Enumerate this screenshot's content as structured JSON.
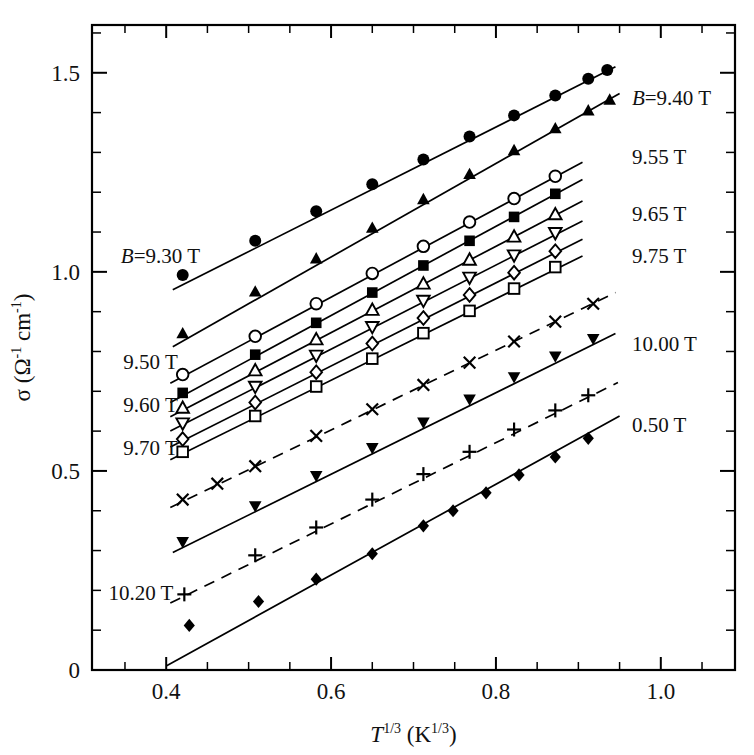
{
  "chart_data": {
    "type": "scatter",
    "title": "",
    "xlabel": "T^1/3 (K^1/3)",
    "ylabel": "σ (Ω⁻¹ cm⁻¹)",
    "xlim": [
      0.31,
      1.09
    ],
    "ylim": [
      0.0,
      1.62
    ],
    "xticks_major": [
      0.4,
      0.6,
      0.8,
      1.0
    ],
    "xticks_major_labels": [
      "0.4",
      "0.6",
      "0.8",
      "1.0"
    ],
    "xtick_minor_step": 0.05,
    "yticks_major": [
      0,
      0.5,
      1.0,
      1.5
    ],
    "yticks_major_labels": [
      "0",
      "0.5",
      "1.0",
      "1.5"
    ],
    "ytick_minor_step": 0.1,
    "grid": false,
    "legend_position": "inline-annotations",
    "frame": "box",
    "series": [
      {
        "name": "B=9.30 T",
        "label_left": "B=9.30 T",
        "label_right": "",
        "marker": "filled-circle",
        "fit": {
          "x0": 0.408,
          "y0": 0.955,
          "x1": 0.945,
          "y1": 1.515
        },
        "x": [
          0.42,
          0.508,
          0.582,
          0.65,
          0.712,
          0.768,
          0.822,
          0.872,
          0.912,
          0.935
        ],
        "y": [
          0.992,
          1.078,
          1.152,
          1.22,
          1.282,
          1.34,
          1.393,
          1.443,
          1.485,
          1.507
        ]
      },
      {
        "name": "B=9.40 T",
        "label_left": "",
        "label_right": "B=9.40 T",
        "marker": "filled-triangle-up",
        "fit": {
          "x0": 0.408,
          "y0": 0.812,
          "x1": 0.95,
          "y1": 1.448
        },
        "x": [
          0.42,
          0.508,
          0.582,
          0.65,
          0.712,
          0.768,
          0.822,
          0.872,
          0.912,
          0.938
        ],
        "y": [
          0.845,
          0.95,
          1.033,
          1.11,
          1.182,
          1.245,
          1.305,
          1.36,
          1.405,
          1.432
        ]
      },
      {
        "name": "9.50 T",
        "label_left": "9.50 T",
        "label_right": "",
        "marker": "open-circle",
        "fit": {
          "x0": 0.405,
          "y0": 0.72,
          "x1": 0.905,
          "y1": 1.275
        },
        "x": [
          0.42,
          0.508,
          0.582,
          0.65,
          0.712,
          0.768,
          0.822,
          0.872
        ],
        "y": [
          0.742,
          0.838,
          0.92,
          0.996,
          1.064,
          1.125,
          1.184,
          1.24
        ]
      },
      {
        "name": "9.55 T",
        "label_left": "",
        "label_right": "9.55 T",
        "marker": "filled-square",
        "fit": {
          "x0": 0.405,
          "y0": 0.672,
          "x1": 0.905,
          "y1": 1.232
        },
        "x": [
          0.42,
          0.508,
          0.582,
          0.65,
          0.712,
          0.768,
          0.822,
          0.872
        ],
        "y": [
          0.696,
          0.792,
          0.872,
          0.948,
          1.016,
          1.078,
          1.138,
          1.196
        ]
      },
      {
        "name": "9.60 T",
        "label_left": "9.60 T",
        "label_right": "",
        "marker": "open-triangle-up",
        "fit": {
          "x0": 0.405,
          "y0": 0.636,
          "x1": 0.905,
          "y1": 1.178
        },
        "x": [
          0.42,
          0.508,
          0.582,
          0.65,
          0.712,
          0.768,
          0.822,
          0.872
        ],
        "y": [
          0.658,
          0.752,
          0.83,
          0.904,
          0.97,
          1.03,
          1.088,
          1.144
        ]
      },
      {
        "name": "9.65 T",
        "label_left": "",
        "label_right": "9.65 T",
        "marker": "open-triangle-down",
        "fit": {
          "x0": 0.405,
          "y0": 0.6,
          "x1": 0.905,
          "y1": 1.128
        },
        "x": [
          0.42,
          0.508,
          0.582,
          0.65,
          0.712,
          0.768,
          0.822,
          0.872
        ],
        "y": [
          0.62,
          0.712,
          0.79,
          0.862,
          0.928,
          0.986,
          1.042,
          1.098
        ]
      },
      {
        "name": "9.70 T",
        "label_left": "9.70 T",
        "label_right": "",
        "marker": "open-diamond",
        "fit": {
          "x0": 0.405,
          "y0": 0.56,
          "x1": 0.905,
          "y1": 1.082
        },
        "x": [
          0.42,
          0.508,
          0.582,
          0.65,
          0.712,
          0.768,
          0.822,
          0.872
        ],
        "y": [
          0.58,
          0.672,
          0.748,
          0.82,
          0.884,
          0.942,
          0.998,
          1.052
        ]
      },
      {
        "name": "9.75 T",
        "label_left": "",
        "label_right": "9.75 T",
        "marker": "open-square",
        "fit": {
          "x0": 0.405,
          "y0": 0.528,
          "x1": 0.905,
          "y1": 1.04
        },
        "x": [
          0.42,
          0.508,
          0.582,
          0.65,
          0.712,
          0.768,
          0.822,
          0.872
        ],
        "y": [
          0.548,
          0.638,
          0.712,
          0.782,
          0.846,
          0.902,
          0.958,
          1.012
        ]
      },
      {
        "name": "10.00 T (x)",
        "label_left": "",
        "label_right": "",
        "marker": "cross-x",
        "dashed": true,
        "fit": {
          "x0": 0.405,
          "y0": 0.408,
          "x1": 0.945,
          "y1": 0.948
        },
        "x": [
          0.42,
          0.462,
          0.508,
          0.582,
          0.65,
          0.712,
          0.768,
          0.822,
          0.872,
          0.918
        ],
        "y": [
          0.428,
          0.468,
          0.512,
          0.588,
          0.655,
          0.716,
          0.772,
          0.825,
          0.875,
          0.92
        ]
      },
      {
        "name": "10.00 T",
        "label_left": "",
        "label_right": "10.00 T",
        "marker": "filled-triangle-down",
        "fit": {
          "x0": 0.408,
          "y0": 0.295,
          "x1": 0.945,
          "y1": 0.845
        },
        "x": [
          0.42,
          0.508,
          0.582,
          0.65,
          0.712,
          0.768,
          0.822,
          0.872,
          0.918
        ],
        "y": [
          0.322,
          0.412,
          0.488,
          0.558,
          0.622,
          0.68,
          0.736,
          0.788,
          0.832
        ]
      },
      {
        "name": "10.20 T",
        "label_left": "10.20 T",
        "label_right": "",
        "marker": "plus",
        "dashed": true,
        "fit": {
          "x0": 0.405,
          "y0": 0.168,
          "x1": 0.948,
          "y1": 0.722
        },
        "x": [
          0.422,
          0.508,
          0.582,
          0.65,
          0.712,
          0.768,
          0.822,
          0.872,
          0.912
        ],
        "y": [
          0.19,
          0.288,
          0.358,
          0.428,
          0.492,
          0.548,
          0.604,
          0.652,
          0.69
        ]
      },
      {
        "name": "0.50 T",
        "label_left": "",
        "label_right": "0.50 T",
        "marker": "filled-diamond",
        "fit": {
          "x0": 0.4,
          "y0": 0.01,
          "x1": 0.95,
          "y1": 0.638
        },
        "x": [
          0.428,
          0.512,
          0.582,
          0.65,
          0.712,
          0.748,
          0.788,
          0.828,
          0.872,
          0.912
        ],
        "y": [
          0.112,
          0.172,
          0.228,
          0.292,
          0.362,
          0.4,
          0.445,
          0.49,
          0.535,
          0.582
        ]
      }
    ],
    "annotations": [
      {
        "text": "B=9.30 T",
        "italic_prefix": "B",
        "x": 0.345,
        "y": 1.022,
        "anchor": "start",
        "for": "B=9.30 T"
      },
      {
        "text": "9.50 T",
        "x": 0.348,
        "y": 0.755,
        "anchor": "start",
        "for": "9.50 T"
      },
      {
        "text": "9.60 T",
        "x": 0.348,
        "y": 0.648,
        "anchor": "start",
        "for": "9.60 T"
      },
      {
        "text": "9.70 T",
        "x": 0.348,
        "y": 0.54,
        "anchor": "start",
        "for": "9.70 T"
      },
      {
        "text": "10.20 T",
        "x": 0.33,
        "y": 0.175,
        "anchor": "start",
        "for": "10.20 T"
      },
      {
        "text": "B=9.40 T",
        "italic_prefix": "B",
        "x": 0.965,
        "y": 1.42,
        "anchor": "start",
        "for": "B=9.40 T"
      },
      {
        "text": "9.55 T",
        "x": 0.965,
        "y": 1.272,
        "anchor": "start",
        "for": "9.55 T"
      },
      {
        "text": "9.65 T",
        "x": 0.965,
        "y": 1.128,
        "anchor": "start",
        "for": "9.65 T"
      },
      {
        "text": "9.75 T",
        "x": 0.965,
        "y": 1.022,
        "anchor": "start",
        "for": "9.75 T"
      },
      {
        "text": "10.00 T",
        "x": 0.965,
        "y": 0.8,
        "anchor": "start",
        "for": "10.00 T"
      },
      {
        "text": "0.50 T",
        "x": 0.965,
        "y": 0.598,
        "anchor": "start",
        "for": "0.50 T"
      }
    ],
    "axis_title_x_parts": {
      "sym": "T",
      "sup": "1/3",
      "unit_open": " (K",
      "unit_sup": "1/3",
      "unit_close": ")"
    },
    "axis_title_y_parts": {
      "sym": "σ",
      "open": " (Ω",
      "sup1": "-1",
      "mid": " cm",
      "sup2": "-1",
      "close": ")"
    },
    "colors": {
      "ink": "#111111",
      "line": "#000000",
      "background": "#ffffff"
    }
  }
}
